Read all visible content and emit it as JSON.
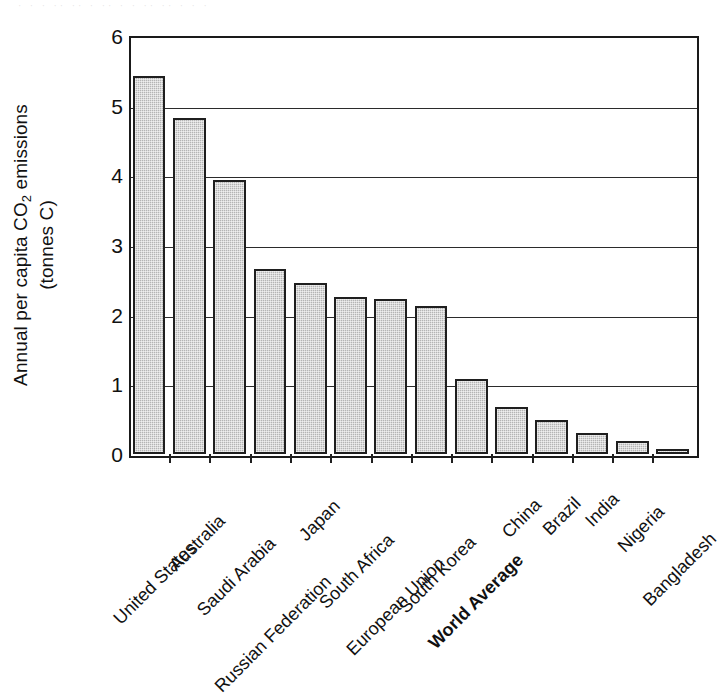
{
  "scan_artifact_text": "· · ·   ·· ·· ·   ·· ·  ·   ·· ·· ·    · ·",
  "axes": {
    "ylabel_line1_pre": "Annual per capita CO",
    "ylabel_line1_sub": "2",
    "ylabel_line1_post": " emissions",
    "ylabel_line2": "(tonnes C)",
    "ytick_labels": [
      "6",
      "5",
      "4",
      "3",
      "2",
      "1",
      "0"
    ]
  },
  "colors": {
    "bar_fill": "#b4b4b4",
    "bar_stroke": "#1f1f1f",
    "axis": "#1a1a1a",
    "gridline": "#2b2b2b",
    "background": "#ffffff"
  },
  "chart_data": {
    "type": "bar",
    "title": "",
    "xlabel": "",
    "ylabel": "Annual per capita CO2 emissions (tonnes C)",
    "ylim": [
      0,
      6
    ],
    "yticks": [
      0,
      1,
      2,
      3,
      4,
      5,
      6
    ],
    "grid": true,
    "legend": "none",
    "orientation": "vertical",
    "categories": [
      "United States",
      "Australia",
      "Saudi Arabia",
      "Russian Federation",
      "Japan",
      "South Africa",
      "European Union",
      "South Korea",
      "World Average",
      "China",
      "Brazil",
      "India",
      "Nigeria",
      "Bangladesh"
    ],
    "values": [
      5.43,
      4.82,
      3.93,
      2.66,
      2.45,
      2.25,
      2.22,
      2.13,
      1.07,
      0.68,
      0.49,
      0.3,
      0.18,
      0.05
    ],
    "emphasis": [
      "World Average"
    ]
  }
}
